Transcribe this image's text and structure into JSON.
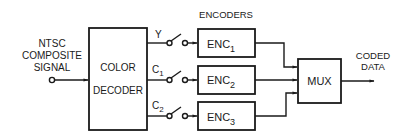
{
  "diagram": {
    "type": "block-diagram",
    "input": {
      "label_lines": [
        "NTSC",
        "COMPOSITE",
        "SIGNAL"
      ]
    },
    "decoder": {
      "label_lines": [
        "COLOR",
        "DECODER"
      ]
    },
    "channels": [
      {
        "signal": "Y",
        "signal_sub": "",
        "encoder": "ENC",
        "encoder_sub": "1"
      },
      {
        "signal": "C",
        "signal_sub": "1",
        "encoder": "ENC",
        "encoder_sub": "2"
      },
      {
        "signal": "C",
        "signal_sub": "2",
        "encoder": "ENC",
        "encoder_sub": "3"
      }
    ],
    "encoders_heading": "ENCODERS",
    "mux": {
      "label": "MUX"
    },
    "output": {
      "label_lines": [
        "CODED",
        "DATA"
      ]
    },
    "colors": {
      "ink": "#1a1a1a",
      "background": "#ffffff"
    }
  }
}
